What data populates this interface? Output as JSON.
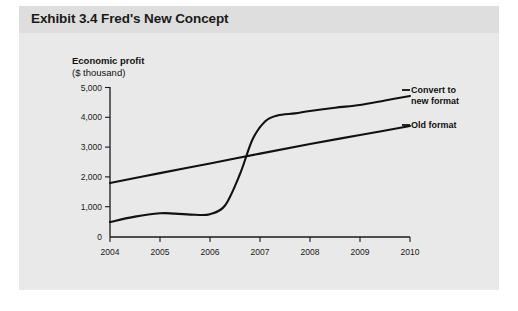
{
  "exhibit": {
    "title": "Exhibit 3.4 Fred's New Concept"
  },
  "axis_caption": {
    "line1": "Economic profit",
    "line2": "($ thousand)"
  },
  "legend": {
    "new_format_line1": "Convert to",
    "new_format_line2": "new format",
    "old_format": "Old format"
  },
  "colors": {
    "page_background": "#ffffff",
    "panel_background": "#e9e9e9",
    "title_band": "#dedede",
    "axis": "#1a1a1a",
    "series": "#111111",
    "text": "#1a1a1a"
  },
  "chart_data": {
    "type": "line",
    "title": "Exhibit 3.4 Fred's New Concept",
    "xlabel": "",
    "ylabel": "Economic profit ($ thousand)",
    "xlim": [
      2004,
      2010
    ],
    "ylim": [
      0,
      5000
    ],
    "ytick_labels": [
      "0",
      "1,000",
      "2,000",
      "3,000",
      "4,000",
      "5,000"
    ],
    "ytick_values": [
      0,
      1000,
      2000,
      3000,
      4000,
      5000
    ],
    "xtick_labels": [
      "2004",
      "2005",
      "2006",
      "2007",
      "2008",
      "2009",
      "2010"
    ],
    "xtick_values": [
      2004,
      2005,
      2006,
      2007,
      2008,
      2009,
      2010
    ],
    "grid": false,
    "legend_position": "right-inline",
    "series": [
      {
        "name": "Convert to new format",
        "x": [
          2004,
          2004.5,
          2005,
          2005.3,
          2005.7,
          2006,
          2006.3,
          2006.6,
          2006.85,
          2007.1,
          2007.35,
          2007.7,
          2008,
          2008.5,
          2009,
          2009.5,
          2010
        ],
        "values": [
          500,
          680,
          790,
          780,
          740,
          760,
          1050,
          2100,
          3250,
          3850,
          4050,
          4120,
          4200,
          4310,
          4400,
          4550,
          4700
        ]
      },
      {
        "name": "Old format",
        "x": [
          2004,
          2005,
          2006,
          2007,
          2008,
          2009,
          2010
        ],
        "values": [
          1800,
          2130,
          2450,
          2780,
          3100,
          3400,
          3700
        ]
      }
    ],
    "annotations": [
      {
        "text": "Crossover of new format above old format",
        "x": 2006.8,
        "y": 2800
      }
    ]
  }
}
